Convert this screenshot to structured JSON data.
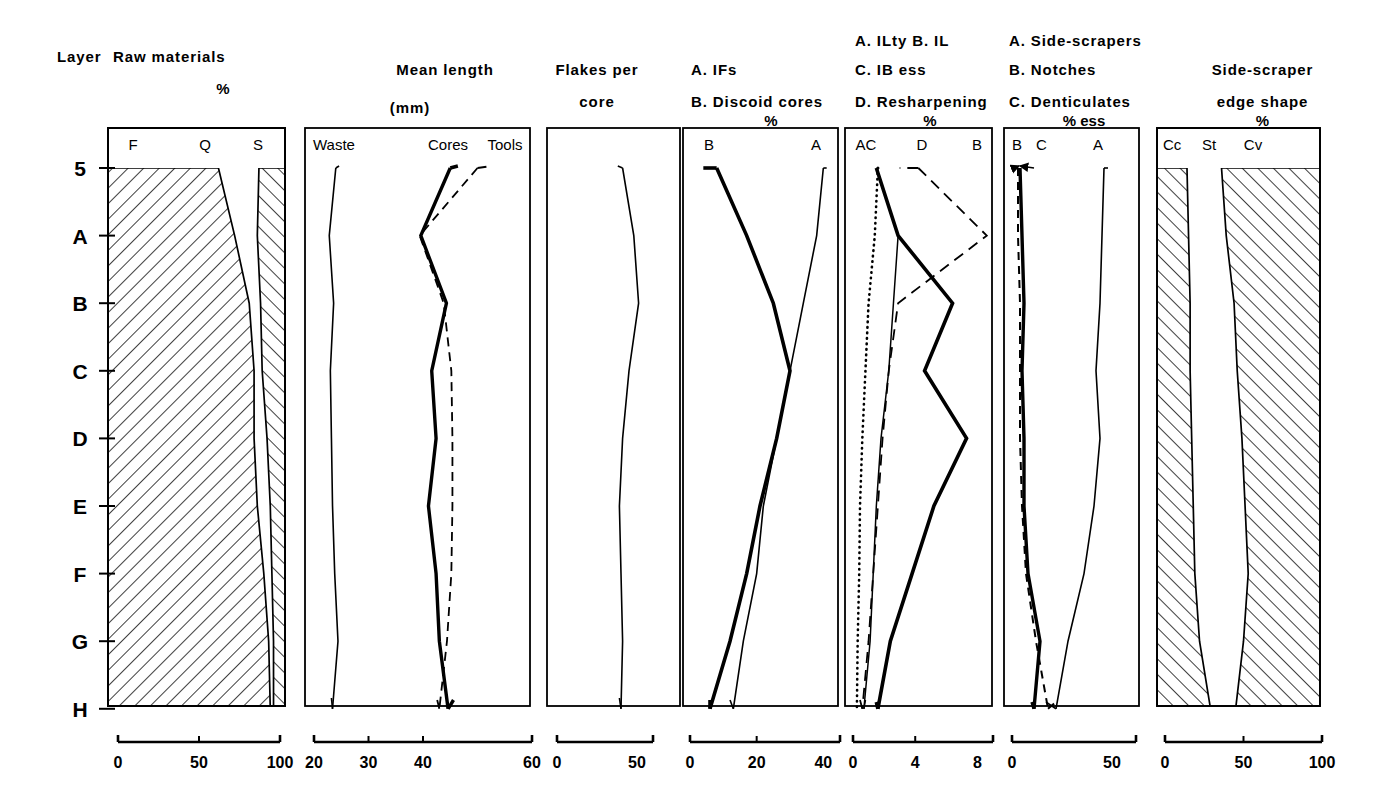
{
  "figure": {
    "kind": "stratigraphic-diagram",
    "row_axis_title": "Layer",
    "layers": [
      "5",
      "A",
      "B",
      "C",
      "D",
      "E",
      "F",
      "G",
      "H"
    ]
  },
  "panels": [
    {
      "id": "raw-materials",
      "title_lines": [
        "Raw materials"
      ],
      "unit": "%",
      "series_labels": [
        "F",
        "Q",
        "S"
      ],
      "axis": {
        "ticks": [
          "0",
          "50",
          "100"
        ],
        "min": 0,
        "max": 100
      },
      "style": "cumulative-hatched"
    },
    {
      "id": "mean-length",
      "title_lines": [
        "Mean length"
      ],
      "unit": "(mm)",
      "series_labels": [
        "Waste",
        "Cores",
        "Tools"
      ],
      "axis": {
        "ticks": [
          "20",
          "30",
          "40",
          "60"
        ],
        "min": 20,
        "max": 60
      },
      "style": "lines"
    },
    {
      "id": "flakes-per-core",
      "title_lines": [
        "Flakes per",
        "core"
      ],
      "unit": "",
      "series_labels": [],
      "axis": {
        "ticks": [
          "0",
          "50"
        ],
        "min": 0,
        "max": 60
      },
      "style": "lines"
    },
    {
      "id": "ifs-discoid",
      "title_lines": [
        "A. IFs",
        "B. Discoid cores"
      ],
      "unit": "%",
      "series_labels": [
        "B",
        "A"
      ],
      "axis": {
        "ticks": [
          "0",
          "20",
          "40"
        ],
        "min": 0,
        "max": 45
      },
      "style": "lines"
    },
    {
      "id": "ilty-il-ib-resharpening",
      "title_lines": [
        "A. ILty    B. IL",
        "C. IB ess",
        "D. Resharpening"
      ],
      "unit": "%",
      "series_labels": [
        "AC",
        "D",
        "B"
      ],
      "axis": {
        "ticks": [
          "0",
          "4",
          "8"
        ],
        "min": 0,
        "max": 9
      },
      "style": "lines"
    },
    {
      "id": "side-scrapers-notches-denticulates",
      "title_lines": [
        "A. Side-scrapers",
        "B. Notches",
        "C. Denticulates"
      ],
      "unit": "% ess",
      "series_labels": [
        "B",
        "C",
        "A"
      ],
      "axis": {
        "ticks": [
          "0",
          "50"
        ],
        "min": 0,
        "max": 62
      },
      "style": "lines"
    },
    {
      "id": "side-scraper-edge-shape",
      "title_lines": [
        "Side-scraper",
        "edge shape"
      ],
      "unit": "%",
      "series_labels": [
        "Cc",
        "St",
        "Cv"
      ],
      "axis": {
        "ticks": [
          "0",
          "50",
          "100"
        ],
        "min": 0,
        "max": 100
      },
      "style": "cumulative-hatched"
    }
  ],
  "chart_data": {
    "type": "line",
    "title": "",
    "ylabel": "Layer",
    "categories": [
      "5",
      "A",
      "B",
      "C",
      "D",
      "E",
      "F",
      "G",
      "H"
    ],
    "panels": [
      {
        "name": "Raw materials",
        "type": "area",
        "xlabel": "%",
        "xlim": [
          0,
          100
        ],
        "xticks": [
          0,
          50,
          100
        ],
        "series": [
          {
            "name": "F",
            "hatch": true,
            "values": [
              62,
              72,
              81,
              84,
              84,
              86,
              90,
              93,
              94
            ]
          },
          {
            "name": "Q",
            "hatch": false,
            "values": [
              25,
              14,
              7,
              5,
              8,
              8,
              5,
              3,
              2
            ]
          },
          {
            "name": "S",
            "hatch": true,
            "values": [
              13,
              14,
              12,
              11,
              8,
              6,
              5,
              4,
              4
            ]
          }
        ]
      },
      {
        "name": "Mean length (mm)",
        "type": "line",
        "xlabel": "(mm)",
        "xlim": [
          20,
          60
        ],
        "xticks": [
          20,
          30,
          40,
          60
        ],
        "series": [
          {
            "name": "Waste",
            "style": "solid-thin",
            "values": [
              24.0,
              22.8,
              23.6,
              23.0,
              23.2,
              23.4,
              23.8,
              24.4,
              23.4
            ]
          },
          {
            "name": "Cores",
            "style": "solid-bold",
            "values": [
              45.0,
              39.6,
              44.3,
              41.6,
              42.4,
              41.0,
              42.4,
              43.0,
              44.6
            ]
          },
          {
            "name": "Tools",
            "style": "dashed",
            "values": [
              50.0,
              39.4,
              43.8,
              45.2,
              45.4,
              45.4,
              45.2,
              44.4,
              43.0
            ]
          }
        ]
      },
      {
        "name": "Flakes per core",
        "type": "line",
        "xlabel": "",
        "xlim": [
          0,
          60
        ],
        "xticks": [
          0,
          50
        ],
        "series": [
          {
            "name": "Flakes per core",
            "style": "solid-thin",
            "values": [
              41,
              48,
              51,
              45,
              41,
              39,
              40,
              41,
              40
            ]
          }
        ]
      },
      {
        "name": "A. IFs  B. Discoid cores",
        "type": "line",
        "xlabel": "%",
        "xlim": [
          0,
          45
        ],
        "xticks": [
          0,
          20,
          40
        ],
        "series": [
          {
            "name": "B",
            "style": "solid-bold",
            "values": [
              8,
              17,
              25,
              30,
              26,
              21,
              17,
              12,
              6
            ]
          },
          {
            "name": "A",
            "style": "solid-thin",
            "values": [
              40,
              38,
              34,
              30,
              26,
              22,
              20,
              16,
              13
            ]
          }
        ]
      },
      {
        "name": "A. ILty  B. IL  C. IB ess  D. Resharpening",
        "type": "line",
        "xlabel": "%",
        "xlim": [
          0,
          9
        ],
        "xticks": [
          0,
          4,
          8
        ],
        "series": [
          {
            "name": "A (ILty)",
            "style": "solid-thin",
            "values": [
              1.5,
              2.9,
              2.6,
              2.3,
              1.8,
              1.5,
              1.3,
              1.1,
              0.7
            ]
          },
          {
            "name": "B (IL)",
            "style": "solid-bold",
            "values": [
              1.5,
              2.9,
              6.4,
              4.6,
              7.3,
              5.2,
              3.8,
              2.4,
              1.6
            ]
          },
          {
            "name": "C (IB ess)",
            "style": "dotted",
            "values": [
              1.6,
              1.4,
              1.0,
              0.8,
              0.6,
              0.45,
              0.4,
              0.3,
              0.25
            ]
          },
          {
            "name": "D (Resharpening)",
            "style": "dashed",
            "values": [
              4.2,
              8.6,
              2.9,
              2.3,
              1.9,
              1.6,
              1.3,
              1.0,
              0.6
            ]
          }
        ]
      },
      {
        "name": "A. Side-scrapers  B. Notches  C. Denticulates",
        "type": "line",
        "xlabel": "% ess",
        "xlim": [
          0,
          62
        ],
        "xticks": [
          0,
          50
        ],
        "series": [
          {
            "name": "A",
            "style": "solid-thin",
            "values": [
              46,
              45,
              44,
              42,
              44,
              41,
              36,
              28,
              22
            ]
          },
          {
            "name": "B",
            "style": "solid-bold",
            "values": [
              4,
              5,
              6,
              5,
              6,
              6,
              8,
              14,
              11
            ]
          },
          {
            "name": "C",
            "style": "dashed",
            "values": [
              3,
              3,
              4,
              4,
              4,
              5,
              7,
              12,
              18
            ]
          }
        ]
      },
      {
        "name": "Side-scraper edge shape",
        "type": "area",
        "xlabel": "%",
        "xlim": [
          0,
          100
        ],
        "xticks": [
          0,
          50,
          100
        ],
        "series": [
          {
            "name": "Cc",
            "hatch": true,
            "values": [
              14,
              15,
              16,
              16,
              17,
              18,
              19,
              22,
              29
            ]
          },
          {
            "name": "St",
            "hatch": false,
            "values": [
              22,
              24,
              28,
              30,
              32,
              33,
              34,
              28,
              16
            ]
          },
          {
            "name": "Cv",
            "hatch": true,
            "values": [
              64,
              61,
              56,
              54,
              51,
              49,
              47,
              50,
              55
            ]
          }
        ]
      }
    ]
  }
}
